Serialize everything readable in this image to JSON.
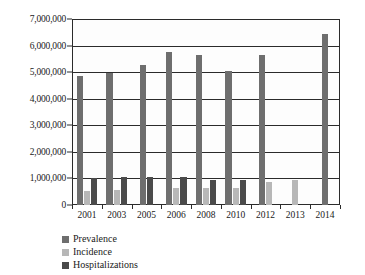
{
  "chart_data": {
    "type": "bar",
    "title": "",
    "xlabel": "",
    "ylabel": "",
    "grid": true,
    "legend_position": "bottom-left",
    "categories": [
      "2001",
      "2003",
      "2005",
      "2006",
      "2008",
      "2010",
      "2012",
      "2013",
      "2014"
    ],
    "ylim": [
      0,
      7000000
    ],
    "ytick_values": [
      0,
      1000000,
      2000000,
      3000000,
      4000000,
      5000000,
      6000000,
      7000000
    ],
    "ytick_labels": [
      "0",
      "1,000,000",
      "2,000,000",
      "3,000,000",
      "4,000,000",
      "5,000,000",
      "6,000,000",
      "7,000,000"
    ],
    "series": [
      {
        "name": "Prevalence",
        "color": "#6e6e6e",
        "values": [
          4870000,
          4980000,
          5260000,
          5770000,
          5650000,
          5030000,
          5630000,
          null,
          6450000
        ]
      },
      {
        "name": "Incidence",
        "color": "#b7b7b7",
        "values": [
          520000,
          550000,
          null,
          650000,
          650000,
          630000,
          850000,
          930000,
          null
        ]
      },
      {
        "name": "Hospitalizations",
        "color": "#4a4a4a",
        "values": [
          1000000,
          1060000,
          1050000,
          1070000,
          960000,
          960000,
          null,
          null,
          null
        ]
      }
    ]
  },
  "legend": {
    "items": [
      {
        "label": "Prevalence"
      },
      {
        "label": "Incidence"
      },
      {
        "label": "Hospitalizations"
      }
    ]
  }
}
